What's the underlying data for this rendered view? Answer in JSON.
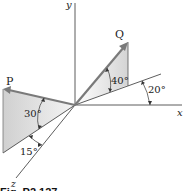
{
  "figure": {
    "caption": "Fig. P2.127",
    "axes": {
      "x": "x",
      "y": "y",
      "z": "z"
    },
    "vectors": [
      {
        "name": "P",
        "label": "P"
      },
      {
        "name": "Q",
        "label": "Q"
      }
    ],
    "angles": {
      "q_elevation": "40°",
      "q_plane": "20°",
      "p_elevation": "30°",
      "p_plane": "15°"
    },
    "colors": {
      "shade": "#d9d9d9",
      "vector": "#7a7a7a",
      "line": "#333333"
    }
  }
}
